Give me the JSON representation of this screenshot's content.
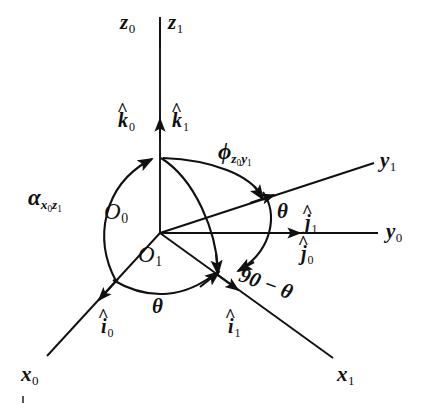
{
  "figure": {
    "type": "coordinate-frame-rotation-diagram",
    "ink_color": "#101010",
    "background_color": "#ffffff"
  },
  "axes": [
    {
      "id": "z0",
      "base": "z",
      "sub": "0",
      "label": "z0"
    },
    {
      "id": "z1",
      "base": "z",
      "sub": "1",
      "label": "z1"
    },
    {
      "id": "y0",
      "base": "y",
      "sub": "0",
      "label": "y0"
    },
    {
      "id": "y1",
      "base": "y",
      "sub": "1",
      "label": "y1"
    },
    {
      "id": "x0",
      "base": "x",
      "sub": "0",
      "label": "x0"
    },
    {
      "id": "x1",
      "base": "x",
      "sub": "1",
      "label": "x1"
    }
  ],
  "unit_vectors": [
    {
      "id": "k0",
      "base": "k",
      "sub": "0",
      "hat": "^"
    },
    {
      "id": "k1",
      "base": "k",
      "sub": "1",
      "hat": "^"
    },
    {
      "id": "j0",
      "base": "j",
      "sub": "0",
      "hat": "^"
    },
    {
      "id": "j1",
      "base": "j",
      "sub": "1",
      "hat": "^"
    },
    {
      "id": "i0",
      "base": "i",
      "sub": "0",
      "hat": "^"
    },
    {
      "id": "i1",
      "base": "i",
      "sub": "1",
      "hat": "^"
    }
  ],
  "origins": [
    {
      "id": "O0",
      "base": "O",
      "sub": "0"
    },
    {
      "id": "O1",
      "base": "O",
      "sub": "1"
    }
  ],
  "angles": {
    "alpha": {
      "base": "α",
      "sub_first": "x",
      "sub_first_idx": "0",
      "sub_second": "z",
      "sub_second_idx": "1"
    },
    "phi": {
      "base": "ϕ",
      "sub_first": "z",
      "sub_first_idx": "0",
      "sub_second": "y",
      "sub_second_idx": "1"
    },
    "theta_upper": "θ",
    "theta_lower": "θ",
    "complement": "90 − θ"
  }
}
